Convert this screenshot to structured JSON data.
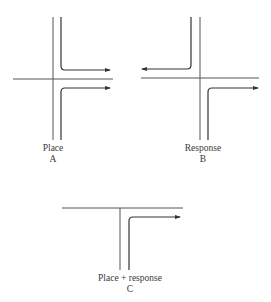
{
  "colors": {
    "line": "#555555",
    "path": "#333333",
    "text": "#3a3a3a",
    "background": "#ffffff"
  },
  "panels": [
    {
      "id": "A",
      "label": "Place",
      "letter": "A"
    },
    {
      "id": "B",
      "label": "Response",
      "letter": "B"
    },
    {
      "id": "C",
      "label": "Place + response",
      "letter": "C"
    }
  ]
}
